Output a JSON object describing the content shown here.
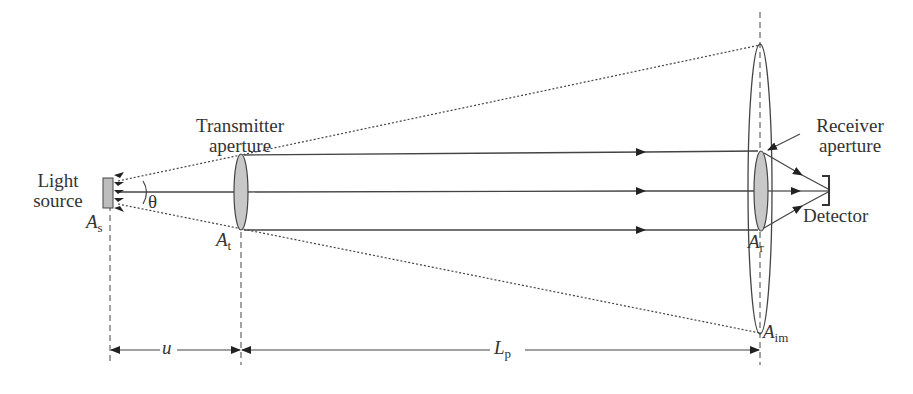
{
  "diagram": {
    "labels": {
      "light_source": [
        "Light",
        "source"
      ],
      "source_area": {
        "symbol": "A",
        "sub": "s"
      },
      "theta": "θ",
      "transmitter": [
        "Transmitter",
        "aperture"
      ],
      "transmitter_area": {
        "symbol": "A",
        "sub": "t"
      },
      "receiver": [
        "Receiver",
        "aperture"
      ],
      "receiver_area": {
        "symbol": "A",
        "sub": "r"
      },
      "detector": "Detector",
      "image_area": {
        "symbol": "A",
        "sub": "im"
      },
      "distance_u": "u",
      "distance_lp": {
        "symbol": "L",
        "sub": "p"
      }
    },
    "colors": {
      "line": "#333333",
      "lens_fill": "#c8c8c8",
      "source_fill": "#bdbdbd"
    }
  }
}
